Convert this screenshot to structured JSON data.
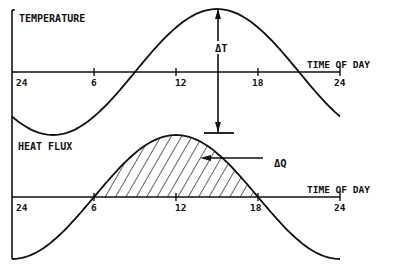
{
  "chart_data": [
    {
      "type": "line",
      "title": "TEMPERATURE",
      "xlabel": "TIME OF DAY",
      "ylabel": "",
      "x_ticks": [
        "24",
        "6",
        "12",
        "18",
        "24"
      ],
      "x": [
        0,
        3,
        6,
        9,
        12,
        15,
        18,
        21,
        24
      ],
      "series": [
        {
          "name": "Temperature",
          "values": [
            -0.71,
            -1.0,
            -0.71,
            0,
            0.71,
            1.0,
            0.71,
            0,
            -0.71
          ]
        }
      ],
      "peak_hour": 15,
      "annotations": [
        {
          "text": "ΔT",
          "description": "Vertical double arrow from temperature peak down to bar below axis"
        }
      ]
    },
    {
      "type": "area",
      "title": "HEAT FLUX",
      "xlabel": "TIME OF DAY",
      "ylabel": "",
      "x_ticks": [
        "24",
        "6",
        "12",
        "18",
        "24"
      ],
      "x": [
        0,
        3,
        6,
        9,
        12,
        15,
        18,
        21,
        24
      ],
      "series": [
        {
          "name": "Heat flux",
          "values": [
            -1.0,
            -0.71,
            0,
            0.71,
            1.0,
            0.71,
            0,
            -0.71,
            -1.0
          ]
        }
      ],
      "peak_hour": 12,
      "shaded_region": [
        6,
        18
      ],
      "annotations": [
        {
          "text": "ΔQ",
          "description": "Arrow pointing into hatched positive heat flux area"
        }
      ]
    }
  ],
  "labels": {
    "top_title": "TEMPERATURE",
    "bottom_title": "HEAT FLUX",
    "axis_label": "TIME OF DAY",
    "delta_t": "ΔT",
    "delta_q": "ΔQ",
    "ticks": [
      "24",
      "6",
      "12",
      "18",
      "24"
    ]
  }
}
